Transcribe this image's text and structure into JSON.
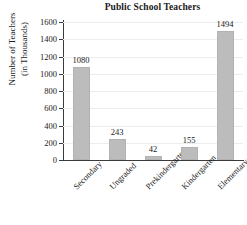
{
  "chart_data": {
    "type": "bar",
    "title": "Public School Teachers",
    "xlabel": "",
    "ylabel": "Number of Teachers (in Thousands)",
    "ylabel_line1": "Number of Teachers",
    "ylabel_line2": "(in Thousands)",
    "categories": [
      "Secondary",
      "Ungraded",
      "Prekindergarten",
      "Kindergarten",
      "Elementary"
    ],
    "values": [
      1080,
      243,
      42,
      155,
      1494
    ],
    "value_labels": [
      "1080",
      "243",
      "42",
      "155",
      "1494"
    ],
    "ylim": [
      0,
      1600
    ],
    "ytick_values": [
      0,
      200,
      400,
      600,
      800,
      1000,
      1200,
      1400,
      1600
    ],
    "ytick_labels": [
      "0",
      "200",
      "400",
      "600",
      "800",
      "1000",
      "1200",
      "1400",
      "1600"
    ],
    "grid": "horizontal",
    "legend": "none",
    "bar_color": "#bcbcbc",
    "axis_color": "#3b3b3b",
    "grid_color": "#ededed",
    "text_color": "#1a1a1a"
  }
}
